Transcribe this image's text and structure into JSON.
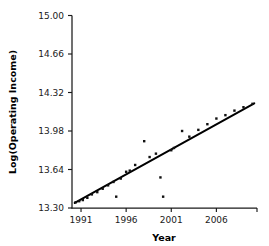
{
  "chart_data": {
    "type": "scatter",
    "title": "",
    "xlabel": "Year",
    "ylabel": "Log(Operating Income)",
    "xlim": [
      1990,
      2010.5
    ],
    "ylim": [
      13.3,
      15.0
    ],
    "xticks": [
      1991,
      1996,
      2001,
      2006
    ],
    "xtick_labels": [
      "1991",
      "1996",
      "2001",
      "2006"
    ],
    "yticks": [
      13.3,
      13.64,
      13.98,
      14.32,
      14.66,
      15.0
    ],
    "ytick_labels": [
      "13.30",
      "13.64",
      "13.98",
      "14.32",
      "14.66",
      "15.00"
    ],
    "grid": false,
    "legend": "none",
    "marker_color": "#111111",
    "line_color": "#000000",
    "points": [
      {
        "x": 1990.4,
        "y": 13.35
      },
      {
        "x": 1990.8,
        "y": 13.36
      },
      {
        "x": 1991.2,
        "y": 13.37
      },
      {
        "x": 1991.7,
        "y": 13.39
      },
      {
        "x": 1992.2,
        "y": 13.42
      },
      {
        "x": 1992.8,
        "y": 13.44
      },
      {
        "x": 1993.4,
        "y": 13.47
      },
      {
        "x": 1994.0,
        "y": 13.5
      },
      {
        "x": 1994.6,
        "y": 13.53
      },
      {
        "x": 1994.9,
        "y": 13.4
      },
      {
        "x": 1995.4,
        "y": 13.56
      },
      {
        "x": 1996.0,
        "y": 13.62
      },
      {
        "x": 1996.4,
        "y": 13.63
      },
      {
        "x": 1997.0,
        "y": 13.68
      },
      {
        "x": 1998.0,
        "y": 13.89
      },
      {
        "x": 1998.6,
        "y": 13.75
      },
      {
        "x": 1999.3,
        "y": 13.78
      },
      {
        "x": 1999.8,
        "y": 13.57
      },
      {
        "x": 2000.1,
        "y": 13.4
      },
      {
        "x": 2001.0,
        "y": 13.81
      },
      {
        "x": 2001.3,
        "y": 13.83
      },
      {
        "x": 2002.2,
        "y": 13.98
      },
      {
        "x": 2003.0,
        "y": 13.93
      },
      {
        "x": 2004.0,
        "y": 13.99
      },
      {
        "x": 2005.0,
        "y": 14.04
      },
      {
        "x": 2006.0,
        "y": 14.09
      },
      {
        "x": 2007.0,
        "y": 14.12
      },
      {
        "x": 2008.0,
        "y": 14.16
      },
      {
        "x": 2009.0,
        "y": 14.19
      },
      {
        "x": 2010.0,
        "y": 14.22
      }
    ],
    "fit_line": {
      "x_start": 1990.3,
      "y_start": 13.345,
      "x_end": 2010.2,
      "y_end": 14.225
    }
  }
}
